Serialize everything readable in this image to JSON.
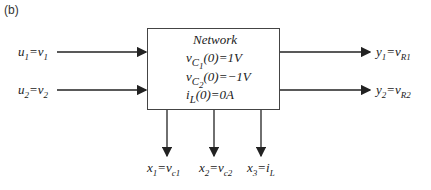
{
  "panel_label": "(b)",
  "block": {
    "title": "Network",
    "conditions": [
      {
        "var": "v",
        "sub": "C",
        "subsub": "1",
        "rest": "(0)=1V"
      },
      {
        "var": "v",
        "sub": "C",
        "subsub": "2",
        "rest": "(0)=−1V"
      },
      {
        "var": "i",
        "sub": "L",
        "subsub": "",
        "rest": "(0)=0A"
      }
    ]
  },
  "inputs": [
    {
      "lhs": "u",
      "lhs_sub": "1",
      "rhs": "v",
      "rhs_sub": "1"
    },
    {
      "lhs": "u",
      "lhs_sub": "2",
      "rhs": "v",
      "rhs_sub": "2"
    }
  ],
  "outputs": [
    {
      "lhs": "y",
      "lhs_sub": "1",
      "rhs": "v",
      "rhs_sub": "R1"
    },
    {
      "lhs": "y",
      "lhs_sub": "2",
      "rhs": "v",
      "rhs_sub": "R2"
    }
  ],
  "states": [
    {
      "lhs": "x",
      "lhs_sub": "1",
      "rhs": "v",
      "rhs_sub": "c1"
    },
    {
      "lhs": "x",
      "lhs_sub": "2",
      "rhs": "v",
      "rhs_sub": "c2"
    },
    {
      "lhs": "x",
      "lhs_sub": "3",
      "rhs": "i",
      "rhs_sub": "L"
    }
  ]
}
